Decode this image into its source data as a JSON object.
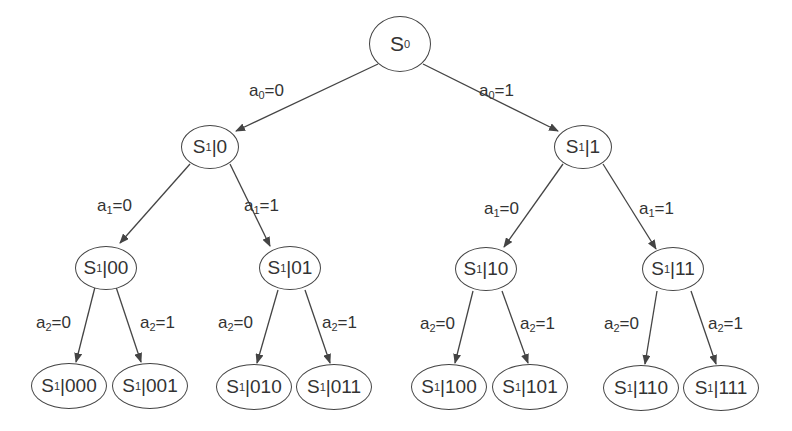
{
  "diagram": {
    "type": "binary decision tree",
    "nodes": [
      {
        "id": "s0",
        "base": "S",
        "sub": "0",
        "suffix": "",
        "cx": 400,
        "cy": 44,
        "w": 62,
        "h": 56
      },
      {
        "id": "s1_0",
        "base": "S",
        "sub": "1",
        "suffix": "|0",
        "cx": 210,
        "cy": 147,
        "w": 58,
        "h": 44
      },
      {
        "id": "s1_1",
        "base": "S",
        "sub": "1",
        "suffix": "|1",
        "cx": 583,
        "cy": 147,
        "w": 58,
        "h": 44
      },
      {
        "id": "s1_00",
        "base": "S",
        "sub": "1",
        "suffix": "|00",
        "cx": 106,
        "cy": 268,
        "w": 62,
        "h": 44
      },
      {
        "id": "s1_01",
        "base": "S",
        "sub": "1",
        "suffix": "|01",
        "cx": 290,
        "cy": 268,
        "w": 62,
        "h": 44
      },
      {
        "id": "s1_10",
        "base": "S",
        "sub": "1",
        "suffix": "|10",
        "cx": 486,
        "cy": 269,
        "w": 62,
        "h": 44
      },
      {
        "id": "s1_11",
        "base": "S",
        "sub": "1",
        "suffix": "|11",
        "cx": 673,
        "cy": 269,
        "w": 62,
        "h": 44
      },
      {
        "id": "s1_000",
        "base": "S",
        "sub": "1",
        "suffix": "|000",
        "cx": 69,
        "cy": 386,
        "w": 76,
        "h": 46
      },
      {
        "id": "s1_001",
        "base": "S",
        "sub": "1",
        "suffix": "|001",
        "cx": 150,
        "cy": 386,
        "w": 76,
        "h": 46
      },
      {
        "id": "s1_010",
        "base": "S",
        "sub": "1",
        "suffix": "|010",
        "cx": 254,
        "cy": 387,
        "w": 76,
        "h": 46
      },
      {
        "id": "s1_011",
        "base": "S",
        "sub": "1",
        "suffix": "|011",
        "cx": 334,
        "cy": 387,
        "w": 76,
        "h": 46
      },
      {
        "id": "s1_100",
        "base": "S",
        "sub": "1",
        "suffix": "|100",
        "cx": 449,
        "cy": 387,
        "w": 76,
        "h": 46
      },
      {
        "id": "s1_101",
        "base": "S",
        "sub": "1",
        "suffix": "|101",
        "cx": 530,
        "cy": 387,
        "w": 76,
        "h": 46
      },
      {
        "id": "s1_110",
        "base": "S",
        "sub": "1",
        "suffix": "|110",
        "cx": 641,
        "cy": 388,
        "w": 76,
        "h": 46
      },
      {
        "id": "s1_111",
        "base": "S",
        "sub": "1",
        "suffix": "|111",
        "cx": 721,
        "cy": 388,
        "w": 76,
        "h": 46
      }
    ],
    "edges": [
      {
        "from": "s0",
        "to": "s1_0",
        "x1": 378,
        "y1": 64,
        "x2": 236,
        "y2": 131,
        "label": {
          "var": "a",
          "sub": "0",
          "val": "=0",
          "x": 249,
          "y": 81
        }
      },
      {
        "from": "s0",
        "to": "s1_1",
        "x1": 423,
        "y1": 64,
        "x2": 558,
        "y2": 131,
        "label": {
          "var": "a",
          "sub": "0",
          "val": "=1",
          "x": 479,
          "y": 81
        }
      },
      {
        "from": "s1_0",
        "to": "s1_00",
        "x1": 190,
        "y1": 164,
        "x2": 120,
        "y2": 243,
        "label": {
          "var": "a",
          "sub": "1",
          "val": "=0",
          "x": 97,
          "y": 196
        }
      },
      {
        "from": "s1_0",
        "to": "s1_01",
        "x1": 230,
        "y1": 164,
        "x2": 270,
        "y2": 246,
        "label": {
          "var": "a",
          "sub": "1",
          "val": "=1",
          "x": 244,
          "y": 196
        }
      },
      {
        "from": "s1_1",
        "to": "s1_10",
        "x1": 563,
        "y1": 164,
        "x2": 504,
        "y2": 247,
        "label": {
          "var": "a",
          "sub": "1",
          "val": "=0",
          "x": 484,
          "y": 199
        }
      },
      {
        "from": "s1_1",
        "to": "s1_11",
        "x1": 603,
        "y1": 164,
        "x2": 656,
        "y2": 249,
        "label": {
          "var": "a",
          "sub": "1",
          "val": "=1",
          "x": 639,
          "y": 199
        }
      },
      {
        "from": "s1_00",
        "to": "s1_000",
        "x1": 95,
        "y1": 287,
        "x2": 76,
        "y2": 362,
        "label": {
          "var": "a",
          "sub": "2",
          "val": "=0",
          "x": 36,
          "y": 313
        }
      },
      {
        "from": "s1_00",
        "to": "s1_001",
        "x1": 116,
        "y1": 287,
        "x2": 141,
        "y2": 362,
        "label": {
          "var": "a",
          "sub": "2",
          "val": "=1",
          "x": 140,
          "y": 313
        }
      },
      {
        "from": "s1_01",
        "to": "s1_010",
        "x1": 278,
        "y1": 290,
        "x2": 257,
        "y2": 363,
        "label": {
          "var": "a",
          "sub": "2",
          "val": "=0",
          "x": 218,
          "y": 313
        }
      },
      {
        "from": "s1_01",
        "to": "s1_011",
        "x1": 305,
        "y1": 290,
        "x2": 330,
        "y2": 363,
        "label": {
          "var": "a",
          "sub": "2",
          "val": "=1",
          "x": 322,
          "y": 313
        }
      },
      {
        "from": "s1_10",
        "to": "s1_100",
        "x1": 473,
        "y1": 291,
        "x2": 455,
        "y2": 363,
        "label": {
          "var": "a",
          "sub": "2",
          "val": "=0",
          "x": 420,
          "y": 314
        }
      },
      {
        "from": "s1_10",
        "to": "s1_101",
        "x1": 502,
        "y1": 291,
        "x2": 528,
        "y2": 363,
        "label": {
          "var": "a",
          "sub": "2",
          "val": "=1",
          "x": 520,
          "y": 314
        }
      },
      {
        "from": "s1_11",
        "to": "s1_110",
        "x1": 657,
        "y1": 291,
        "x2": 645,
        "y2": 364,
        "label": {
          "var": "a",
          "sub": "2",
          "val": "=0",
          "x": 604,
          "y": 314
        }
      },
      {
        "from": "s1_11",
        "to": "s1_111",
        "x1": 691,
        "y1": 291,
        "x2": 716,
        "y2": 364,
        "label": {
          "var": "a",
          "sub": "2",
          "val": "=1",
          "x": 708,
          "y": 314
        }
      }
    ],
    "colors": {
      "stroke": "#444444",
      "text": "#333333",
      "background": "#ffffff"
    }
  }
}
